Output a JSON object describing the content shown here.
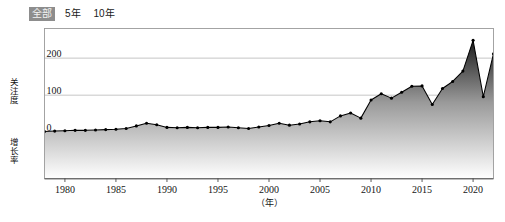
{
  "toolbar": {
    "buttons": [
      {
        "label": "全部",
        "selected": true
      },
      {
        "label": "5年",
        "selected": false
      },
      {
        "label": "10年",
        "selected": false
      }
    ]
  },
  "axis": {
    "y_label_top": "关注度",
    "y_label_bottom": "增长率",
    "x_unit": "（年）",
    "y_ticks": [
      "0",
      "100",
      "200"
    ],
    "x_ticks": [
      "1980",
      "1985",
      "1990",
      "1995",
      "2000",
      "2005",
      "2010",
      "2015",
      "2020"
    ]
  },
  "colors": {
    "line": "#000000",
    "marker": "#000000",
    "area_top": "#1c1c1c",
    "area_bottom": "#ffffff",
    "grid": "#b8b8b8",
    "frame": "#9a9a9a",
    "selected_button_bg": "#8d8d8d",
    "selected_button_text": "#f2f2f2"
  },
  "chart_data": {
    "type": "area",
    "title": "",
    "xlabel": "（年）",
    "ylabel": "关注度 / 增长率",
    "xlim": [
      1978,
      2022
    ],
    "ylim": [
      -125,
      280
    ],
    "grid": true,
    "legend": "none",
    "x": [
      1978,
      1979,
      1980,
      1981,
      1982,
      1983,
      1984,
      1985,
      1986,
      1987,
      1988,
      1989,
      1990,
      1991,
      1992,
      1993,
      1994,
      1995,
      1996,
      1997,
      1998,
      1999,
      2000,
      2001,
      2002,
      2003,
      2004,
      2005,
      2006,
      2007,
      2008,
      2009,
      2010,
      2011,
      2012,
      2013,
      2014,
      2015,
      2016,
      2017,
      2018,
      2019,
      2020,
      2021,
      2022
    ],
    "values": [
      2,
      3,
      4,
      5,
      5,
      6,
      7,
      8,
      10,
      17,
      24,
      20,
      13,
      12,
      13,
      12,
      13,
      13,
      14,
      12,
      10,
      14,
      18,
      24,
      19,
      22,
      28,
      31,
      28,
      44,
      52,
      38,
      87,
      104,
      92,
      108,
      124,
      125,
      75,
      118,
      137,
      165,
      248,
      96,
      212
    ],
    "series": [
      {
        "name": "关注度",
        "values": [
          2,
          3,
          4,
          5,
          5,
          6,
          7,
          8,
          10,
          17,
          24,
          20,
          13,
          12,
          13,
          12,
          13,
          13,
          14,
          12,
          10,
          14,
          18,
          24,
          19,
          22,
          28,
          31,
          28,
          44,
          52,
          38,
          87,
          104,
          92,
          108,
          124,
          125,
          75,
          118,
          137,
          165,
          248,
          96,
          212
        ]
      }
    ]
  }
}
